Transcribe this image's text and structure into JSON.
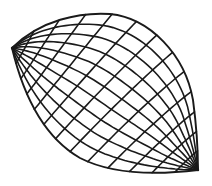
{
  "diagram": {
    "stroke_color": "#1a1a1a",
    "background": "#ffffff",
    "poles": {
      "left": {
        "x": 12,
        "y": 48
      },
      "right": {
        "x": 198,
        "y": 170
      }
    },
    "outline": {
      "upper": "M12,48 C40,20 80,12 110,14 C150,18 185,55 193,100 C197,130 198,155 198,170",
      "lower": "M12,48 C22,90 40,135 80,158 C115,176 165,174 198,170"
    },
    "family_left_count": 9,
    "family_right_count": 9
  }
}
